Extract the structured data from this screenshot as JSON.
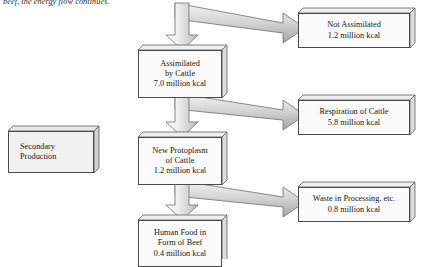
{
  "caption": {
    "text": "beef, the energy flow continues."
  },
  "diagram": {
    "colors": {
      "box_border": "#4a4a4a",
      "box_fill": "#fbfbfb",
      "shaded_box_fill": "#f1f1f1",
      "arrow_fill_light": "#f0f0f0",
      "arrow_fill_mid": "#c9c9c9",
      "arrow_fill_dark": "#9a9a9a",
      "arrow_stroke": "#6e6e6e",
      "text": "#171717"
    },
    "boxes": [
      {
        "id": "secondary-production",
        "lines": [
          "Secondary",
          "Production"
        ],
        "shaded": true,
        "align": "left"
      },
      {
        "id": "assimilated-by-cattle",
        "lines": [
          "Assimilated",
          "by Cattle",
          "7.0 million kcal"
        ],
        "value": "7.0 million kcal",
        "shaded": false,
        "align": "center"
      },
      {
        "id": "not-assimilated",
        "lines": [
          "Not Assimilated",
          "1.2 million kcal"
        ],
        "value": "1.2 million kcal",
        "shaded": false,
        "align": "center"
      },
      {
        "id": "respiration-of-cattle",
        "lines": [
          "Respiration of Cattle",
          "5.8 million kcal"
        ],
        "value": "5.8 million kcal",
        "shaded": false,
        "align": "center"
      },
      {
        "id": "new-protoplasm-of-cattle",
        "lines": [
          "New Protoplasm",
          "of Cattle",
          "1.2 million kcal"
        ],
        "value": "1.2 million kcal",
        "shaded": false,
        "align": "center"
      },
      {
        "id": "waste-in-processing",
        "lines": [
          "Waste in Processing, etc.",
          "0.8 million kcal"
        ],
        "value": "0.8 million kcal",
        "shaded": false,
        "align": "center"
      },
      {
        "id": "human-food-form-of-beef",
        "lines": [
          "Human Food in",
          "Form of Beef",
          "0.4 million kcal"
        ],
        "value": "0.4 million kcal",
        "shaded": false,
        "align": "center"
      }
    ],
    "flows": [
      {
        "id": "flow-into-assimilated",
        "from": "incoming-energy",
        "to": "assimilated-by-cattle",
        "direction": "down"
      },
      {
        "id": "flow-to-not-assimilated",
        "from": "incoming-energy",
        "to": "not-assimilated",
        "direction": "right"
      },
      {
        "id": "flow-to-new-protoplasm",
        "from": "assimilated-by-cattle",
        "to": "new-protoplasm-of-cattle",
        "direction": "down"
      },
      {
        "id": "flow-to-respiration",
        "from": "assimilated-by-cattle",
        "to": "respiration-of-cattle",
        "direction": "right"
      },
      {
        "id": "flow-to-human-food",
        "from": "new-protoplasm-of-cattle",
        "to": "human-food-form-of-beef",
        "direction": "down"
      },
      {
        "id": "flow-to-waste",
        "from": "new-protoplasm-of-cattle",
        "to": "waste-in-processing",
        "direction": "right"
      }
    ]
  }
}
